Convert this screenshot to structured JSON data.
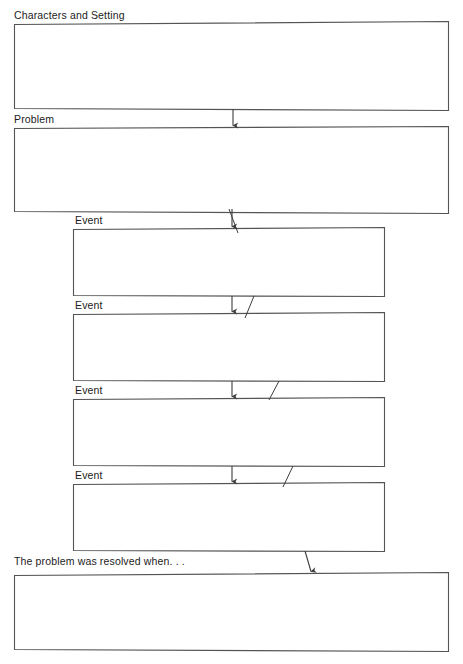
{
  "document": {
    "title": "Story Map Graphic Organizer",
    "page_background": "#ffffff",
    "ink_color": "#4a4a4a",
    "text_color": "#1b1b1b",
    "width_px": 463,
    "height_px": 664
  },
  "sections": [
    {
      "id": "characters-and-setting",
      "label": "Characters and Setting",
      "value": "",
      "placeholder": "",
      "box": {
        "x": 14,
        "y": 24,
        "width": 434,
        "height": 85
      }
    },
    {
      "id": "problem",
      "label": "Problem",
      "value": "",
      "placeholder": "",
      "box": {
        "x": 14,
        "y": 128,
        "width": 434,
        "height": 84
      }
    },
    {
      "id": "event-1",
      "label": "Event",
      "value": "",
      "placeholder": "",
      "box": {
        "x": 73,
        "y": 229,
        "width": 311,
        "height": 66
      }
    },
    {
      "id": "event-2",
      "label": "Event",
      "value": "",
      "placeholder": "",
      "box": {
        "x": 73,
        "y": 314,
        "width": 311,
        "height": 66
      }
    },
    {
      "id": "event-3",
      "label": "Event",
      "value": "",
      "placeholder": "",
      "box": {
        "x": 73,
        "y": 399,
        "width": 311,
        "height": 66
      }
    },
    {
      "id": "event-4",
      "label": "Event",
      "value": "",
      "placeholder": "",
      "box": {
        "x": 73,
        "y": 484,
        "width": 311,
        "height": 66
      }
    },
    {
      "id": "resolution",
      "label": "The problem was resolved when. . .",
      "value": "",
      "placeholder": "",
      "box": {
        "x": 14,
        "y": 574,
        "width": 434,
        "height": 77
      }
    }
  ],
  "connectors": [
    {
      "id": "characters-to-problem",
      "type": "arrow-down",
      "from": "characters-and-setting",
      "to": "problem"
    },
    {
      "id": "problem-to-event-1",
      "type": "arrow-down",
      "from": "problem",
      "to": "event-1"
    },
    {
      "id": "event-1-to-event-2",
      "type": "arrow-down",
      "from": "event-1",
      "to": "event-2"
    },
    {
      "id": "event-2-to-event-3",
      "type": "arrow-down",
      "from": "event-2",
      "to": "event-3"
    },
    {
      "id": "event-3-to-event-4",
      "type": "arrow-down",
      "from": "event-3",
      "to": "event-4"
    },
    {
      "id": "event-4-to-resolution",
      "type": "arrow-diagonal",
      "from": "event-4",
      "to": "resolution"
    }
  ]
}
